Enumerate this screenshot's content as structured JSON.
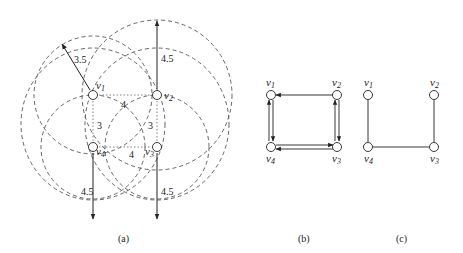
{
  "panels": [
    {
      "caption": "(a)",
      "nodes": [
        {
          "id": "v1",
          "label": "v",
          "sub": "1",
          "x": 93,
          "y": 95
        },
        {
          "id": "v2",
          "label": "v",
          "sub": "2",
          "x": 157,
          "y": 95
        },
        {
          "id": "v3",
          "label": "v",
          "sub": "3",
          "x": 157,
          "y": 147
        },
        {
          "id": "v4",
          "label": "v",
          "sub": "4",
          "x": 93,
          "y": 147
        }
      ],
      "ranges": [
        {
          "node": "v1",
          "radius_label": "3.5"
        },
        {
          "node": "v2",
          "radius_label": "4.5"
        },
        {
          "node": "v3",
          "radius_label": "4.5"
        },
        {
          "node": "v4",
          "radius_label": "4.5"
        }
      ],
      "distances": [
        {
          "from": "v1",
          "to": "v2",
          "label": "4"
        },
        {
          "from": "v4",
          "to": "v3",
          "label": "4"
        },
        {
          "from": "v1",
          "to": "v4",
          "label": "3"
        },
        {
          "from": "v2",
          "to": "v3",
          "label": "3"
        }
      ]
    },
    {
      "caption": "(b)",
      "nodes": [
        {
          "id": "v1",
          "label": "v",
          "sub": "1"
        },
        {
          "id": "v2",
          "label": "v",
          "sub": "2"
        },
        {
          "id": "v3",
          "label": "v",
          "sub": "3"
        },
        {
          "id": "v4",
          "label": "v",
          "sub": "4"
        }
      ],
      "directed_edges": [
        [
          "v2",
          "v1"
        ],
        [
          "v1",
          "v4"
        ],
        [
          "v4",
          "v1"
        ],
        [
          "v4",
          "v3"
        ],
        [
          "v3",
          "v4"
        ],
        [
          "v2",
          "v3"
        ],
        [
          "v3",
          "v2"
        ]
      ]
    },
    {
      "caption": "(c)",
      "nodes": [
        {
          "id": "v1",
          "label": "v",
          "sub": "1"
        },
        {
          "id": "v2",
          "label": "v",
          "sub": "2"
        },
        {
          "id": "v3",
          "label": "v",
          "sub": "3"
        },
        {
          "id": "v4",
          "label": "v",
          "sub": "4"
        }
      ],
      "edges": [
        [
          "v1",
          "v4"
        ],
        [
          "v4",
          "v3"
        ],
        [
          "v2",
          "v3"
        ]
      ]
    }
  ]
}
